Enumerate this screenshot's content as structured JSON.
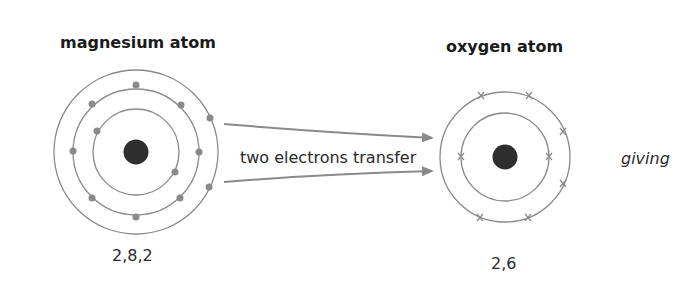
{
  "diagram": {
    "magnesium": {
      "title": "magnesium atom",
      "configuration": "2,8,2",
      "shells": [
        2,
        8,
        2
      ],
      "electron_symbol": "dot"
    },
    "arrow_label": "two electrons transfer",
    "oxygen": {
      "title": "oxygen atom",
      "configuration": "2,6",
      "shells": [
        2,
        6
      ],
      "electron_symbol": "cross"
    },
    "trailing_text": "giving",
    "colors": {
      "shell": "#8a8a8a",
      "electron": "#8a8a8a",
      "nucleus": "#2e2e2e",
      "arrow": "#8a8a8a"
    }
  }
}
